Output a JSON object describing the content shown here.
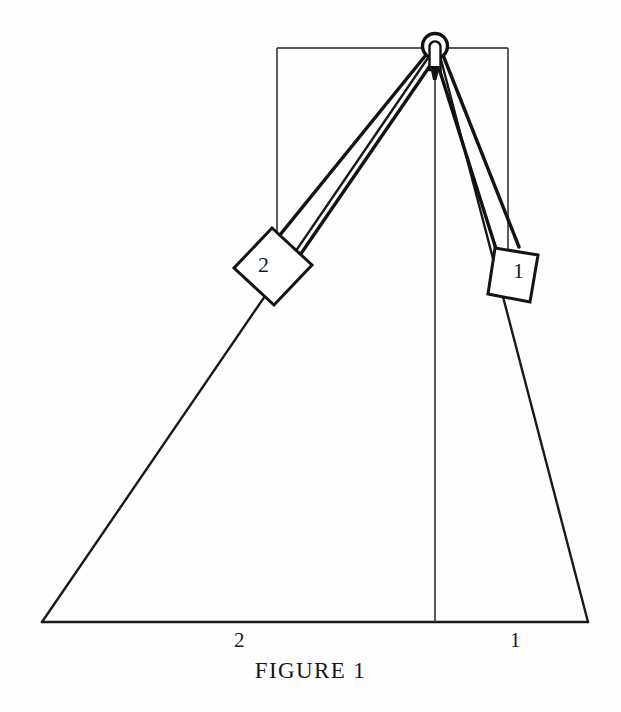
{
  "figure": {
    "caption": "FIGURE 1",
    "background_color": "#fefefe",
    "stroke_color": "#1a1a1a",
    "fill_color": "#ffffff",
    "apex": {
      "name": "ring-pulley",
      "cx": 435,
      "cy": 46,
      "r": 11
    },
    "wedge": {
      "name": "triangle-wedge",
      "apex_x": 435,
      "apex_y": 46,
      "left_base_x": 42,
      "right_base_x": 588,
      "base_y": 622
    },
    "inner_rectangle": {
      "left_x": 277,
      "right_x": 508,
      "top_y": 48,
      "bottom_left_y": 253,
      "bottom_right_y": 256
    },
    "altitude": {
      "x": 435,
      "top_y": 56,
      "bottom_y": 622
    },
    "blocks": [
      {
        "id": "block-1",
        "label": "1",
        "side": "right",
        "label_x": 513,
        "label_y": 258
      },
      {
        "id": "block-2",
        "label": "2",
        "side": "left",
        "label_x": 258,
        "label_y": 252
      }
    ],
    "base_labels": [
      {
        "id": "base-label-2",
        "text": "2",
        "x": 234,
        "y": 628
      },
      {
        "id": "base-label-1",
        "text": "1",
        "x": 510,
        "y": 628
      }
    ]
  }
}
